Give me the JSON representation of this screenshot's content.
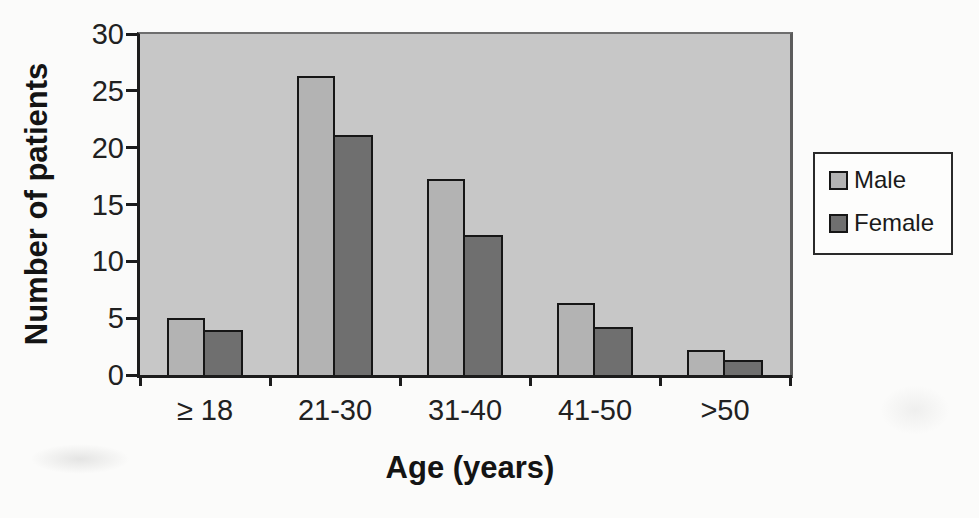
{
  "colors": {
    "page_bg": "#fbfbfa",
    "plot_bg": "#c7c7c7",
    "male_fill": "#b3b3b3",
    "female_fill": "#6f6f6f",
    "ink": "#1c1c1c"
  },
  "legend": {
    "position": "right",
    "entries": [
      "Male",
      "Female"
    ]
  },
  "chart_data": {
    "type": "bar",
    "title": "",
    "xlabel": "Age (years)",
    "ylabel": "Number of patients",
    "categories": [
      "≥ 18",
      "21-30",
      "31-40",
      "41-50",
      ">50"
    ],
    "series": [
      {
        "name": "Male",
        "color": "#b3b3b3",
        "values": [
          5,
          26.3,
          17.2,
          6.3,
          2.2
        ]
      },
      {
        "name": "Female",
        "color": "#6f6f6f",
        "values": [
          4,
          21.1,
          12.3,
          4.2,
          1.3
        ]
      }
    ],
    "ylim": [
      0,
      30
    ],
    "yticks": [
      0,
      5,
      10,
      15,
      20,
      25,
      30
    ],
    "grid": false,
    "legend_position": "right",
    "plot_background": "#c7c7c7"
  }
}
